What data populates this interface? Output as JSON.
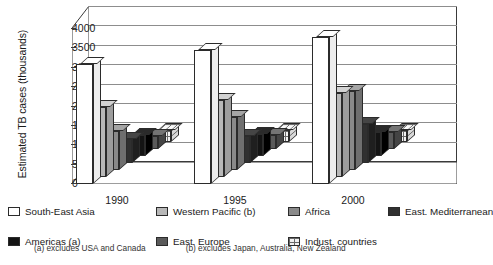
{
  "chart_data": {
    "type": "bar",
    "title": "",
    "xlabel": "",
    "ylabel": "Estimated TB cases (thousands)",
    "categories": [
      "1990",
      "1995",
      "2000"
    ],
    "ylim": [
      0,
      4000
    ],
    "yticks": [
      0,
      500,
      1000,
      1500,
      2000,
      2500,
      3000,
      3500,
      4000
    ],
    "grid": true,
    "legend_position": "below",
    "three_d": true,
    "series": [
      {
        "name": "South-East Asia",
        "fill": "white",
        "values": [
          3100,
          3450,
          3800
        ]
      },
      {
        "name": "Western Pacific (b)",
        "fill": "ltgray",
        "values": [
          1800,
          1980,
          2180
        ]
      },
      {
        "name": "Africa",
        "fill": "mgray",
        "values": [
          1000,
          1380,
          2050
        ]
      },
      {
        "name": "East. Mediterranean",
        "fill": "dark",
        "values": [
          620,
          700,
          1000
        ]
      },
      {
        "name": "Americas (a)",
        "fill": "black",
        "values": [
          540,
          580,
          620
        ]
      },
      {
        "name": "East. Europe",
        "fill": "dgray",
        "values": [
          330,
          360,
          430
        ]
      },
      {
        "name": "Indust. countries",
        "fill": "brick",
        "values": [
          300,
          300,
          300
        ]
      }
    ]
  },
  "legend": {
    "rows": [
      [
        {
          "label": "South-East Asia",
          "fill": "white"
        },
        {
          "label": "Western Pacific (b)",
          "fill": "ltgray"
        },
        {
          "label": "Africa",
          "fill": "mgray"
        },
        {
          "label": "East. Mediterranean",
          "fill": "dark"
        }
      ],
      [
        {
          "label": "Americas (a)",
          "fill": "black"
        },
        {
          "label": "East. Europe",
          "fill": "dgray"
        },
        {
          "label": "Indust. countries",
          "fill": "brick"
        }
      ]
    ]
  },
  "footnotes": {
    "a": "(a) excludes USA and Canada",
    "b": "(b) excludes Japan, Australia, New Zealand"
  }
}
